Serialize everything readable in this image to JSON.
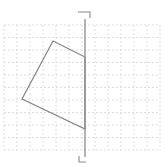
{
  "figure": {
    "background_color": "#ffffff",
    "grid": {
      "line_color": "#d4d4d4",
      "dash_pattern": "2 2",
      "stroke_width": 0.8,
      "x_start": 4,
      "x_end": 160,
      "x_step": 13,
      "y_start": 25,
      "y_end": 150,
      "y_step": 12.5
    },
    "reflection_line": {
      "color": "#8a8a8a",
      "stroke_width": 1.3,
      "x": 85,
      "y1": 19,
      "y2": 157,
      "top_tick_points": "78,12 90,12 90,18",
      "bottom_tick_points": "79,156 79,162 86,162",
      "tick_color": "#8a8a8a",
      "tick_stroke_width": 1.1
    },
    "polygon": {
      "color": "#838383",
      "stroke_width": 1.2,
      "fill": "none",
      "points": [
        [
          53,
          41
        ],
        [
          85,
          57
        ],
        [
          85,
          129
        ],
        [
          22,
          99
        ]
      ]
    }
  }
}
